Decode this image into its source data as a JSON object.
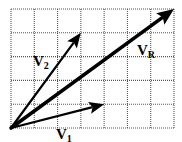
{
  "diagram": {
    "type": "vector-addition",
    "grid": {
      "columns": 7,
      "rows": 5,
      "origin_px": [
        11,
        128
      ],
      "cell_w": 23.2857,
      "cell_h": 23.8,
      "line_color": "#555555",
      "line_style": "dotted"
    },
    "vectors": [
      {
        "id": "v1",
        "label": "V",
        "subscript": "1",
        "components": [
          4,
          1
        ],
        "stroke_width": 2.2,
        "color": "#000000"
      },
      {
        "id": "v2",
        "label": "V",
        "subscript": "2",
        "components": [
          3,
          4
        ],
        "stroke_width": 2.2,
        "color": "#000000"
      },
      {
        "id": "vr",
        "label": "V",
        "subscript": "R",
        "components": [
          7,
          5
        ],
        "stroke_width": 3.6,
        "color": "#000000"
      }
    ],
    "labels": {
      "v1": {
        "text": "V",
        "sub": "1",
        "x": 56,
        "y": 139
      },
      "v2": {
        "text": "V",
        "sub": "2",
        "x": 33,
        "y": 66
      },
      "vr": {
        "text": "V",
        "sub": "R",
        "x": 137,
        "y": 55
      }
    }
  }
}
